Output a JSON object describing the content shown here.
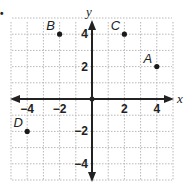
{
  "figure": {
    "bullet": "•",
    "axes": {
      "x_label": "x",
      "y_label": "y",
      "x_ticks": [
        {
          "value": -4,
          "label": "−4"
        },
        {
          "value": -2,
          "label": "−2"
        },
        {
          "value": 2,
          "label": "2"
        },
        {
          "value": 4,
          "label": "4"
        }
      ],
      "y_ticks": [
        {
          "value": 4,
          "label": "4"
        },
        {
          "value": 2,
          "label": "2"
        },
        {
          "value": -2,
          "label": "−2"
        },
        {
          "value": -4,
          "label": "−4"
        }
      ],
      "grid_x_range": [
        -5,
        5
      ],
      "grid_y_range": [
        -5,
        5
      ]
    },
    "points": [
      {
        "name": "A",
        "x": 4,
        "y": 2
      },
      {
        "name": "B",
        "x": -2,
        "y": 4
      },
      {
        "name": "C",
        "x": 2,
        "y": 4
      },
      {
        "name": "D",
        "x": -4,
        "y": -2
      }
    ],
    "colors": {
      "axis": "#222222",
      "grid": "#b8b8b8",
      "point": "#1a1a1a"
    }
  }
}
